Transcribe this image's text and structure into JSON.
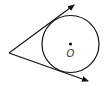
{
  "diagram": {
    "type": "circle-tangents",
    "center_label": "O",
    "circle": {
      "cx": 70.5,
      "cy": 44,
      "r": 28.5
    },
    "external_point": {
      "x": 9,
      "y": 53
    },
    "tangent_upper_end": {
      "x": 74,
      "y": 5
    },
    "tangent_lower_end": {
      "x": 88,
      "y": 81
    },
    "stroke_color": "#111111"
  }
}
